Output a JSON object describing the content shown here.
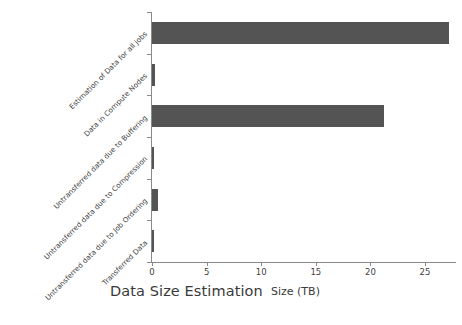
{
  "chart_data": {
    "type": "bar",
    "orientation": "horizontal",
    "title": "Data Size Estimation",
    "xlabel": "Size (TB)",
    "ylabel": "",
    "categories": [
      "Estimation of Data for all jobs",
      "Data in Compute Nodes",
      "Untransferred data due to Buffering",
      "Untransferred data due to Compression",
      "Untransferred data due to Job Ordering",
      "Transferred Data"
    ],
    "values": [
      27.2,
      0.3,
      21.2,
      0.2,
      0.55,
      0.15
    ],
    "xlim": [
      0,
      28.4
    ],
    "xticks": [
      0,
      5,
      10,
      15,
      20,
      25
    ],
    "xtick_labels": [
      "0",
      "5",
      "10",
      "15",
      "20",
      "25"
    ],
    "grid": false,
    "legend": false,
    "bar_color": "#545454",
    "background_color": "#ffffff",
    "axis_color": "#8a8a8a"
  }
}
